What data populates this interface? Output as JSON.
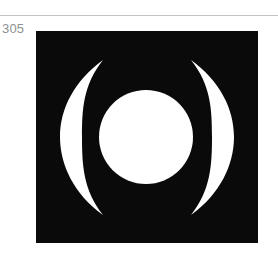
{
  "figure": {
    "number_label": "305",
    "caption": "",
    "divider_color": "#c2c4c6",
    "label_color": "#8e9194",
    "page_background": "#ffffff"
  },
  "symbol": {
    "name": "bracketed-circle-symbol",
    "description": "White filled circle flanked by two tapering crescent arcs on a black square",
    "plate_color": "#0a0a0a",
    "mark_color": "#ffffff",
    "plate": {
      "x": 36,
      "y": 31,
      "width": 222,
      "height": 212
    },
    "center_circle": {
      "cx": 110,
      "cy": 106,
      "r": 47
    },
    "left_arc": {
      "name": "left-crescent",
      "top_tip": {
        "x": 67,
        "y": 29
      },
      "bottom_tip": {
        "x": 67,
        "y": 184
      },
      "outer_extreme_x": 24,
      "inner_extreme_x": 46,
      "thickness": 22
    },
    "right_arc": {
      "name": "right-crescent",
      "top_tip": {
        "x": 155,
        "y": 29
      },
      "bottom_tip": {
        "x": 155,
        "y": 184
      },
      "outer_extreme_x": 198,
      "inner_extreme_x": 176,
      "thickness": 22
    }
  }
}
